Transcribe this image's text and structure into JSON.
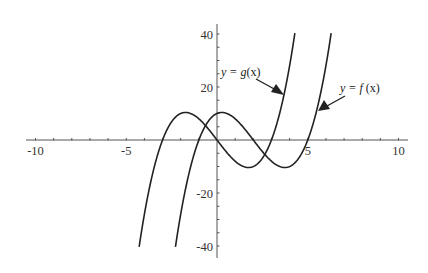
{
  "chart_data": {
    "type": "line",
    "title": "",
    "xlabel": "",
    "ylabel": "",
    "xlim": [
      -10,
      10
    ],
    "ylim": [
      -44,
      44
    ],
    "grid": false,
    "legend": "none (inline arrow annotations)",
    "x_ticks": [
      -10,
      -5,
      5,
      10
    ],
    "x_tick_labels": [
      "-10",
      "-5",
      "5",
      "10"
    ],
    "x_minor_tick_step": 1,
    "y_ticks": [
      40,
      20,
      -20,
      -40
    ],
    "y_tick_labels": [
      "40",
      "20",
      "-20",
      "-40"
    ],
    "y_minor_tick_step": 5,
    "series": [
      {
        "name": "y = g(x)",
        "formula": "x^3 - 9x",
        "shift": 0,
        "roots": [
          -3,
          0,
          3
        ],
        "local_max": [
          -1.73,
          10.39
        ],
        "local_min": [
          1.73,
          -10.39
        ],
        "x_range": [
          -4.29,
          4.29
        ],
        "points": [
          [
            -4.29,
            -40.3
          ],
          [
            -4,
            -28
          ],
          [
            -3,
            0
          ],
          [
            -2,
            10
          ],
          [
            -1.73,
            10.39
          ],
          [
            -1,
            8
          ],
          [
            0,
            0
          ],
          [
            1,
            -8
          ],
          [
            1.73,
            -10.39
          ],
          [
            2,
            -10
          ],
          [
            3,
            0
          ],
          [
            4,
            28
          ],
          [
            4.29,
            40.3
          ]
        ]
      },
      {
        "name": "y = f(x)",
        "formula": "(x-2)^3 - 9(x-2)",
        "shift": 2,
        "roots": [
          -1,
          2,
          5
        ],
        "local_max": [
          0.27,
          10.39
        ],
        "local_min": [
          3.73,
          -10.39
        ],
        "x_range": [
          -2.29,
          6.29
        ],
        "points": [
          [
            -2.29,
            -40.3
          ],
          [
            -2,
            -28
          ],
          [
            -1,
            0
          ],
          [
            0,
            10
          ],
          [
            0.27,
            10.39
          ],
          [
            1,
            8
          ],
          [
            2,
            0
          ],
          [
            3,
            -8
          ],
          [
            3.73,
            -10.39
          ],
          [
            4,
            -10
          ],
          [
            5,
            0
          ],
          [
            6,
            28
          ],
          [
            6.29,
            40.3
          ]
        ]
      }
    ],
    "annotations": [
      {
        "text_pre": "y = ",
        "fn": "g",
        "text_post": "(x)",
        "label": "y = g(x)",
        "arrow_to_series": "y = g(x)"
      },
      {
        "text_pre": "y = ",
        "fn": "f",
        "text_post": " (x)",
        "label": "y = f (x)",
        "arrow_to_series": "y = f(x)"
      }
    ]
  },
  "colors": {
    "curve": "#222222",
    "axis": "#555555",
    "text": "#333333",
    "background": "#ffffff"
  }
}
